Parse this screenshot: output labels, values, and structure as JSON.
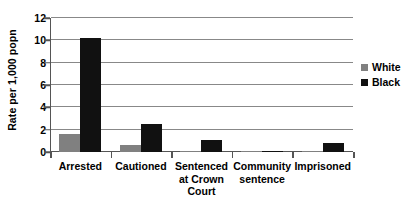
{
  "chart_data": {
    "type": "bar",
    "title": "",
    "xlabel": "",
    "ylabel": "Rate per 1,000 popn",
    "ylim": [
      0,
      12
    ],
    "ytick_step": 2,
    "yticks": [
      0,
      2,
      4,
      6,
      8,
      10,
      12
    ],
    "ytick_labels": [
      "0",
      "2",
      "4",
      "6",
      "8",
      "10",
      "12"
    ],
    "grid": true,
    "legend_position": "right",
    "categories": [
      "Arrested",
      "Cautioned",
      "Sentenced at Crown Court",
      "Community sentence",
      "Imprisoned"
    ],
    "category_lines": [
      [
        "Arrested"
      ],
      [
        "Cautioned"
      ],
      [
        "Sentenced",
        "at Crown",
        "Court"
      ],
      [
        "Community",
        "sentence"
      ],
      [
        "Imprisoned"
      ]
    ],
    "series": [
      {
        "name": "White",
        "color": "#808080",
        "values": [
          1.6,
          0.6,
          0.05,
          0.05,
          0.05
        ]
      },
      {
        "name": "Black",
        "color": "#111111",
        "values": [
          10.2,
          2.5,
          1.05,
          0.1,
          0.8
        ]
      }
    ]
  },
  "legend": {
    "entries": [
      {
        "label": "White",
        "color": "#808080"
      },
      {
        "label": "Black",
        "color": "#111111"
      }
    ]
  },
  "axis": {
    "y_title": "Rate per 1,000 popn"
  }
}
